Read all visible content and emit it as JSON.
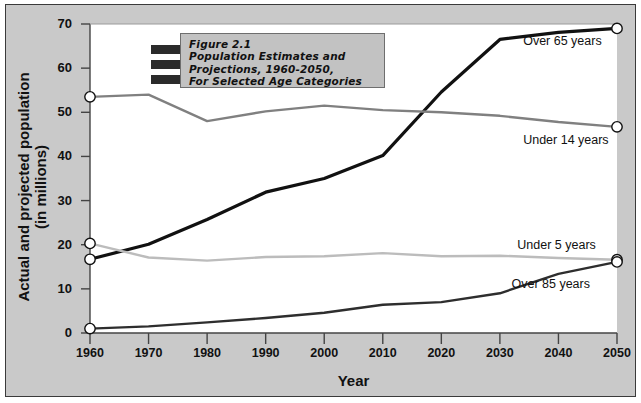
{
  "figure": {
    "title_lines": [
      "Figure 2.1",
      "Population Estimates and",
      "Projections, 1960-2050,",
      "For Selected Age Categories"
    ],
    "background_color": "#c9c9c9",
    "plot_background": "#ffffff",
    "border_color": "#3a3a3a"
  },
  "chart_data": {
    "type": "line",
    "title": "Figure 2.1 Population Estimates and Projections, 1960-2050, For Selected Age Categories",
    "xlabel": "Year",
    "ylabel": "Actual and projected population (in millions)",
    "xlim": [
      1960,
      2050
    ],
    "ylim": [
      0,
      70
    ],
    "xticks": [
      1960,
      1970,
      1980,
      1990,
      2000,
      2010,
      2020,
      2030,
      2040,
      2050
    ],
    "yticks": [
      0,
      10,
      20,
      30,
      40,
      50,
      60,
      70
    ],
    "grid": false,
    "legend_position": "inline-right-endpoint-labels",
    "x": [
      1960,
      1970,
      1980,
      1990,
      2000,
      2010,
      2020,
      2030,
      2040,
      2050
    ],
    "series": [
      {
        "name": "Over 65 years",
        "color": "#111111",
        "width": 3.2,
        "values": [
          16.7,
          20.1,
          25.7,
          31.9,
          35.0,
          40.2,
          54.6,
          66.5,
          68.1,
          69.0
        ]
      },
      {
        "name": "Under 14 years",
        "color": "#808080",
        "width": 2.4,
        "values": [
          53.5,
          54.0,
          48.0,
          50.2,
          51.5,
          50.5,
          50.0,
          49.2,
          47.8,
          46.7
        ]
      },
      {
        "name": "Under 5 years",
        "color": "#bcbcbc",
        "width": 2.4,
        "values": [
          20.3,
          17.1,
          16.4,
          17.2,
          17.4,
          18.1,
          17.4,
          17.5,
          17.0,
          16.6
        ]
      },
      {
        "name": "Over 85 years",
        "color": "#2e2e2e",
        "width": 2.4,
        "values": [
          1.0,
          1.5,
          2.4,
          3.4,
          4.6,
          6.4,
          7.0,
          9.0,
          13.4,
          16.1
        ]
      }
    ],
    "endpoint_markers": {
      "shape": "circle",
      "fill": "#ffffff",
      "stroke": "#111111",
      "at_years": [
        1960,
        2050
      ]
    },
    "annotations": [
      {
        "text": "Over 65 years",
        "x": 2035,
        "y": 66.0
      },
      {
        "text": "Under 14 years",
        "x": 2035,
        "y": 43.5
      },
      {
        "text": "Under 5 years",
        "x": 2034,
        "y": 19.8
      },
      {
        "text": "Over 85 years",
        "x": 2033,
        "y": 10.8
      }
    ]
  },
  "labels": {
    "xticks": [
      "1960",
      "1970",
      "1980",
      "1990",
      "2000",
      "2010",
      "2020",
      "2030",
      "2040",
      "2050"
    ],
    "yticks": [
      "0",
      "10",
      "20",
      "30",
      "40",
      "50",
      "60",
      "70"
    ],
    "xtitle": "Year",
    "ytitle_line1": "Actual and projected population",
    "ytitle_line2": "(in millions)"
  }
}
